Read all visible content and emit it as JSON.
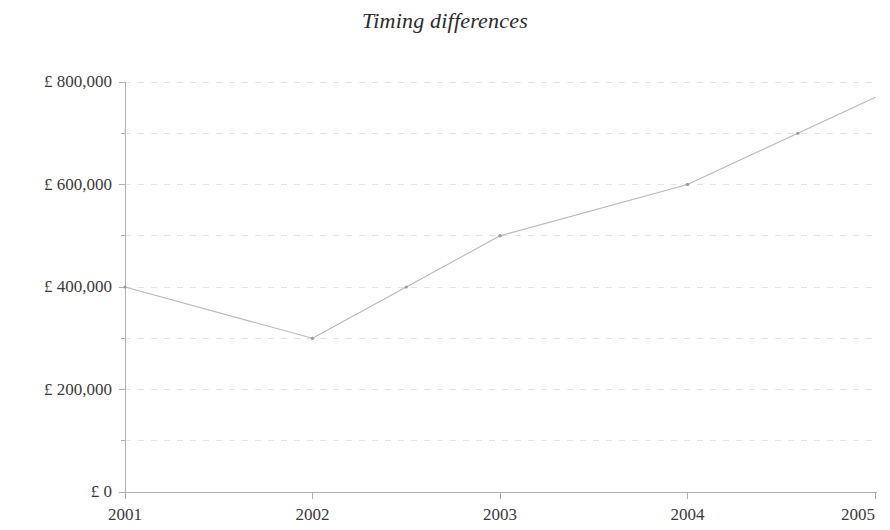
{
  "chart_data": {
    "type": "line",
    "title": "Timing differences",
    "subtitle": "",
    "xlabel": "",
    "ylabel": "",
    "x": [
      2001,
      2002,
      2003,
      2004,
      2005
    ],
    "categories": [
      "2001",
      "2002",
      "2003",
      "2004",
      "2005"
    ],
    "series": [
      {
        "name": "Timing differences",
        "values": [
          400000,
          300000,
          500000,
          600000,
          770000
        ]
      }
    ],
    "values": [
      400000,
      300000,
      500000,
      600000,
      770000
    ],
    "xtick_labels": [
      "2001",
      "2002",
      "2003",
      "2004",
      "2005"
    ],
    "ytick_labels": [
      "£ 0",
      "£ 200,000",
      "£ 400,000",
      "£ 600,000",
      "£ 800,000"
    ],
    "ytick_values": [
      0,
      200000,
      400000,
      600000,
      800000
    ],
    "yminor_values": [
      100000,
      300000,
      500000,
      700000
    ],
    "ylim": [
      0,
      800000
    ],
    "xlim": [
      2001,
      2005
    ],
    "grid": "horizontal-dashed-minor-and-major",
    "legend": "none",
    "line_color": "#b9b9bd",
    "marker": "small-dot",
    "axis_color": "#b0b0b4",
    "grid_color": "#e3e3ea",
    "text_color": "#3a3a3a",
    "title_color": "#2b2b2b",
    "background": "#ffffff"
  },
  "axes": {
    "y_labels": [
      {
        "text": "£ 800,000",
        "value": 800000
      },
      {
        "text": "£ 600,000",
        "value": 600000
      },
      {
        "text": "£ 400,000",
        "value": 400000
      },
      {
        "text": "£ 200,000",
        "value": 200000
      },
      {
        "text": "£ 0",
        "value": 0
      }
    ],
    "x_labels": [
      {
        "text": "2001",
        "value": 2001
      },
      {
        "text": "2002",
        "value": 2002
      },
      {
        "text": "2003",
        "value": 2003
      },
      {
        "text": "2004",
        "value": 2004
      },
      {
        "text": "2005",
        "value": 2005
      }
    ]
  }
}
